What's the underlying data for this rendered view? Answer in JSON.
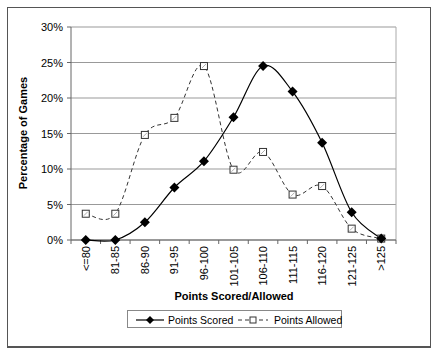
{
  "chart_data": {
    "type": "line",
    "title": "",
    "xlabel": "Points Scored/Allowed",
    "ylabel": "Percentage of Games",
    "ylim": [
      0,
      30
    ],
    "yticks": [
      "0%",
      "5%",
      "10%",
      "15%",
      "20%",
      "25%",
      "30%"
    ],
    "grid": true,
    "legend_position": "bottom",
    "categories": [
      "<=80",
      "81-85",
      "86-90",
      "91-95",
      "96-100",
      "101-105",
      "106-110",
      "111-115",
      "116-120",
      "121-125",
      ">125"
    ],
    "series": [
      {
        "name": "Points Scored",
        "style": "solid line, filled diamond markers",
        "color": "#000000",
        "values": [
          0.0,
          0.0,
          2.5,
          7.4,
          11.1,
          17.3,
          24.5,
          20.9,
          13.7,
          3.9,
          0.2
        ]
      },
      {
        "name": "Points Allowed",
        "style": "dashed line, hollow square markers",
        "color": "#333333",
        "values": [
          3.7,
          3.7,
          14.8,
          17.2,
          24.5,
          9.9,
          12.4,
          6.4,
          7.6,
          1.6,
          0.2
        ]
      }
    ]
  },
  "legend": {
    "items": [
      {
        "label": "Points Scored"
      },
      {
        "label": "Points Allowed"
      }
    ]
  }
}
